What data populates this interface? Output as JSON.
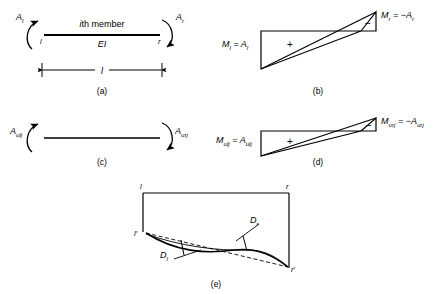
{
  "figure": {
    "panels": [
      {
        "tag": "(a)",
        "name": "member-end-moments",
        "labels": {
          "moment_left": "A",
          "moment_left_sub": "l",
          "moment_right": "A",
          "moment_right_sub": "r",
          "member_title": "ith member",
          "member_title_italic_part": "i",
          "member_title_rest": "th member",
          "stiffness": "EI",
          "node_left": "l",
          "node_right": "r",
          "length": "l"
        }
      },
      {
        "tag": "(b)",
        "name": "bending-moment-diagram-actual",
        "labels": {
          "left_equation": "M",
          "left_equation_sub": "l",
          "left_equation_rhs": " = A",
          "left_equation_rhs_sub": "l",
          "right_equation": "M",
          "right_equation_sub": "r",
          "right_equation_rhs": " = −A",
          "right_equation_rhs_sub": "r",
          "positive_sign": "+",
          "negative_sign": "−"
        }
      },
      {
        "tag": "(c)",
        "name": "unit-load-member-end-moments",
        "labels": {
          "moment_left": "A",
          "moment_left_sub": "ulj",
          "moment_right": "A",
          "moment_right_sub": "urj"
        }
      },
      {
        "tag": "(d)",
        "name": "bending-moment-diagram-unit-load",
        "labels": {
          "left_equation": "M",
          "left_equation_sub": "ulj",
          "left_equation_rhs": " = A",
          "left_equation_rhs_sub": "ulj",
          "right_equation": "M",
          "right_equation_sub": "urj",
          "right_equation_rhs": " = −A",
          "right_equation_rhs_sub": "urj",
          "positive_sign": "+",
          "negative_sign": "−"
        }
      },
      {
        "tag": "(e)",
        "name": "deflected-shape-diagram",
        "labels": {
          "corner_top_left": "l",
          "corner_top_right": "r",
          "corner_bottom_left": "l′",
          "corner_bottom_right": "r′",
          "rotation_left": "D",
          "rotation_left_sub": "l",
          "rotation_right": "D",
          "rotation_right_sub": "r"
        }
      }
    ]
  },
  "style": {
    "line_color": "#000000",
    "background": "#ffffff"
  }
}
